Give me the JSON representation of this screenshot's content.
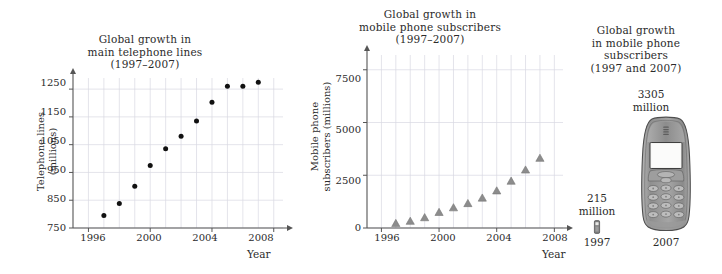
{
  "figure": {
    "axis_name": "Year",
    "panels": [
      "telephone-lines",
      "mobile-subscribers-scatter",
      "mobile-subscribers-pictogram"
    ]
  },
  "panel_lines": {
    "title_line1": "Global growth in",
    "title_line2": "main telephone lines",
    "title_line3": "(1997–2007)",
    "ylabel_line1": "Telephone lines",
    "ylabel_line2": "(millions)",
    "xlabel": "Year",
    "yticks": [
      "750",
      "850",
      "950",
      "1050",
      "1150",
      "1250"
    ],
    "xticks": [
      "1996",
      "2000",
      "2004",
      "2008"
    ]
  },
  "panel_subs": {
    "title_line1": "Global growth in",
    "title_line2": "mobile phone subscribers",
    "title_line3": "(1997–2007)",
    "ylabel_line1": "Mobile phone",
    "ylabel_line2": "subscribers (millions)",
    "xlabel": "Year",
    "yticks": [
      "0",
      "2500",
      "5000",
      "7500"
    ],
    "xticks": [
      "1996",
      "2000",
      "2004",
      "2008"
    ]
  },
  "panel_picto": {
    "title_line1": "Global growth",
    "title_line2": "in mobile phone",
    "title_line3": "subscribers",
    "title_line4": "(1997 and 2007)",
    "value_2007_line1": "3305",
    "value_2007_line2": "million",
    "value_1997_line1": "215",
    "value_1997_line2": "million",
    "year_1997": "1997",
    "year_2007": "2007"
  },
  "colors": {
    "ink": "#2b2b2b",
    "grid": "#d9d9e2",
    "axis": "#555555",
    "marker_dot": "#111111",
    "marker_tri": "#8c8c8c",
    "phone_body": "#9a9a9a",
    "phone_screen": "#f2f2f0"
  },
  "chart_data": [
    {
      "type": "scatter",
      "id": "telephone-lines",
      "title": "Global growth in main telephone lines (1997–2007)",
      "xlabel": "Year",
      "ylabel": "Telephone lines (millions)",
      "xlim": [
        1995,
        2008.6
      ],
      "ylim": [
        750,
        1290
      ],
      "xticks": [
        1996,
        2000,
        2004,
        2008
      ],
      "yticks": [
        750,
        850,
        950,
        1050,
        1150,
        1250
      ],
      "grid": true,
      "legend": "none",
      "marker": "filled-circle",
      "x": [
        1997,
        1998,
        1999,
        2000,
        2001,
        2002,
        2003,
        2004,
        2005,
        2006,
        2007
      ],
      "values": [
        795,
        838,
        900,
        975,
        1035,
        1080,
        1135,
        1203,
        1260,
        1260,
        1275
      ]
    },
    {
      "type": "scatter",
      "id": "mobile-subscribers",
      "title": "Global growth in mobile phone subscribers (1997–2007)",
      "xlabel": "Year",
      "ylabel": "Mobile phone subscribers (millions)",
      "xlim": [
        1995,
        2008.6
      ],
      "ylim": [
        0,
        8200
      ],
      "xticks": [
        1996,
        2000,
        2004,
        2008
      ],
      "yticks": [
        0,
        2500,
        5000,
        7500
      ],
      "grid": true,
      "legend": "none",
      "marker": "filled-triangle",
      "x": [
        1997,
        1998,
        1999,
        2000,
        2001,
        2002,
        2003,
        2004,
        2005,
        2006,
        2007
      ],
      "values": [
        215,
        320,
        490,
        740,
        960,
        1160,
        1420,
        1760,
        2220,
        2750,
        3305
      ]
    },
    {
      "type": "pictogram",
      "id": "mobile-subscribers-pictogram",
      "title": "Global growth in mobile phone subscribers (1997 and 2007)",
      "categories": [
        "1997",
        "2007"
      ],
      "values": [
        215,
        3305
      ],
      "unit": "million",
      "grid": false,
      "legend": "none"
    }
  ]
}
